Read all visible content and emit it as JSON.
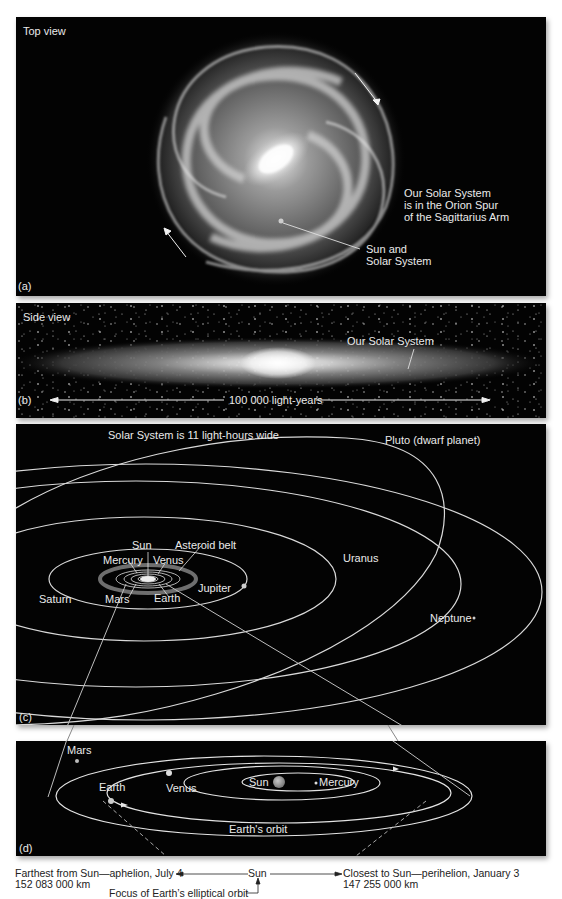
{
  "panels": {
    "a": {
      "letter": "(a)",
      "title": "Top view",
      "location_note": [
        "Our Solar System",
        "is in the Orion Spur",
        "of the Sagittarius Arm"
      ],
      "sun_label": [
        "Sun and",
        "Solar System"
      ]
    },
    "b": {
      "letter": "(b)",
      "title": "Side view",
      "solar_system_label": "Our Solar System",
      "scale_label": "100 000 light-years"
    },
    "c": {
      "letter": "(c)",
      "title": "Solar System is 11 light-hours wide",
      "labels": {
        "pluto": "Pluto (dwarf planet)",
        "sun": "Sun",
        "asteroid_belt": "Asteroid belt",
        "mercury": "Mercury",
        "venus": "Venus",
        "uranus": "Uranus",
        "jupiter": "Jupiter",
        "saturn": "Saturn",
        "mars": "Mars",
        "earth": "Earth",
        "neptune": "Neptune"
      }
    },
    "d": {
      "letter": "(d)",
      "labels": {
        "mars": "Mars",
        "earth": "Earth",
        "venus": "Venus",
        "sun": "Sun",
        "mercury": "Mercury",
        "earths_orbit": "Earth's orbit"
      }
    }
  },
  "caption": {
    "aphelion_line1": "Farthest from Sun—aphelion, July 4",
    "aphelion_line2": "152 083 000 km",
    "sun": "Sun",
    "perihelion_line1": "Closest to Sun—perihelion, January 3",
    "perihelion_line2": "147 255 000 km",
    "focus": "Focus of Earth’s elliptical orbit"
  },
  "colors": {
    "panel_bg": "#030303",
    "orbit_line": "#d9d9d9",
    "text_light": "#eaeaea",
    "caption_text": "#222222",
    "sun_disk": "#9a9a9a"
  }
}
